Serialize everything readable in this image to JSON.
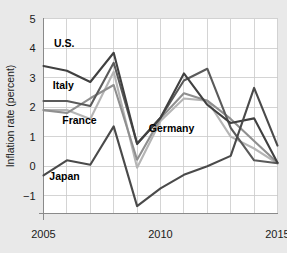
{
  "chart_data": {
    "type": "line",
    "title": "",
    "xlabel": "",
    "ylabel": "Inflation rate (percent)",
    "xlim": [
      2005,
      2015
    ],
    "ylim": [
      -1.6,
      5
    ],
    "xticks": [
      2005,
      2010,
      2015
    ],
    "xtick_labels": [
      "2005",
      "2010",
      "2015"
    ],
    "yticks": [
      -1,
      0,
      1,
      2,
      3,
      4,
      5
    ],
    "ytick_labels": [
      "−1",
      "0",
      "1",
      "2",
      "3",
      "4",
      "5"
    ],
    "grid": true,
    "legend": "inline-labels",
    "x": [
      2005,
      2006,
      2007,
      2008,
      2009,
      2010,
      2011,
      2012,
      2013,
      2014,
      2015
    ],
    "series": [
      {
        "name": "U.S.",
        "color": "#404040",
        "values": [
          3.39,
          3.23,
          2.85,
          3.84,
          0.75,
          1.64,
          3.14,
          2.08,
          1.46,
          1.62,
          0.12
        ],
        "label_x": 2005.45,
        "label_y": 4.02
      },
      {
        "name": "Italy",
        "color": "#5a5a5a",
        "values": [
          2.21,
          2.21,
          2.04,
          3.5,
          0.77,
          1.64,
          2.9,
          3.3,
          1.3,
          0.2,
          0.1
        ],
        "label_x": 2005.4,
        "label_y": 2.62
      },
      {
        "name": "France",
        "color": "#b5b5b5",
        "values": [
          1.9,
          1.9,
          1.6,
          3.2,
          -0.05,
          1.53,
          2.29,
          2.22,
          1.0,
          0.6,
          0.1
        ],
        "label_x": 2005.8,
        "label_y": 1.42
      },
      {
        "name": "Germany",
        "color": "#8f8f8f",
        "values": [
          1.9,
          1.8,
          2.3,
          2.75,
          0.22,
          1.62,
          2.47,
          2.22,
          1.6,
          0.85,
          0.12
        ],
        "label_x": 2009.5,
        "label_y": 1.15
      },
      {
        "name": "Japan",
        "color": "#4a4a4a",
        "values": [
          -0.31,
          0.2,
          0.05,
          1.35,
          -1.35,
          -0.75,
          -0.29,
          0.0,
          0.35,
          2.65,
          0.7
        ],
        "label_x": 2005.25,
        "label_y": -0.48
      }
    ]
  },
  "axis": {
    "ylabel_text": "Inflation rate (percent)"
  }
}
